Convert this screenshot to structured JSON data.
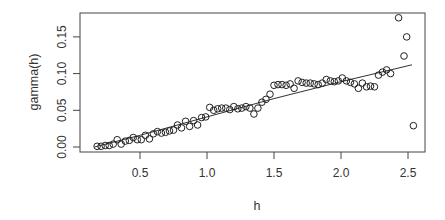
{
  "chart_data": {
    "type": "scatter",
    "title": "",
    "xlabel": "h",
    "ylabel": "gamma(h)",
    "xlim": [
      0.05,
      2.62
    ],
    "ylim": [
      -0.006,
      0.185
    ],
    "xticks": [
      0.5,
      1.0,
      1.5,
      2.0,
      2.5
    ],
    "xtick_labels": [
      "0.5",
      "1.0",
      "1.5",
      "2.0",
      "2.5"
    ],
    "yticks": [
      0.0,
      0.05,
      0.1,
      0.15
    ],
    "ytick_labels": [
      "0.00",
      "0.05",
      "0.10",
      "0.15"
    ],
    "grid": false,
    "legend": null,
    "series": [
      {
        "name": "empirical semivariogram",
        "marker": "open-circle",
        "x": [
          0.18,
          0.21,
          0.24,
          0.27,
          0.3,
          0.33,
          0.36,
          0.39,
          0.42,
          0.45,
          0.48,
          0.51,
          0.54,
          0.57,
          0.6,
          0.63,
          0.66,
          0.69,
          0.72,
          0.75,
          0.78,
          0.81,
          0.84,
          0.87,
          0.9,
          0.93,
          0.96,
          0.99,
          1.02,
          1.05,
          1.08,
          1.11,
          1.14,
          1.17,
          1.2,
          1.23,
          1.26,
          1.29,
          1.32,
          1.35,
          1.38,
          1.41,
          1.44,
          1.47,
          1.5,
          1.53,
          1.56,
          1.59,
          1.62,
          1.65,
          1.68,
          1.71,
          1.74,
          1.77,
          1.8,
          1.83,
          1.86,
          1.89,
          1.92,
          1.95,
          1.98,
          2.01,
          2.04,
          2.07,
          2.1,
          2.13,
          2.16,
          2.19,
          2.22,
          2.25,
          2.28,
          2.31,
          2.34,
          2.37,
          2.43,
          2.47,
          2.49,
          2.54
        ],
        "y": [
          0.001,
          0.001,
          0.002,
          0.002,
          0.004,
          0.01,
          0.004,
          0.008,
          0.009,
          0.013,
          0.01,
          0.01,
          0.016,
          0.011,
          0.018,
          0.021,
          0.019,
          0.02,
          0.022,
          0.023,
          0.03,
          0.026,
          0.035,
          0.028,
          0.036,
          0.03,
          0.04,
          0.041,
          0.054,
          0.05,
          0.052,
          0.053,
          0.053,
          0.051,
          0.055,
          0.052,
          0.053,
          0.055,
          0.053,
          0.045,
          0.053,
          0.061,
          0.065,
          0.072,
          0.084,
          0.085,
          0.085,
          0.084,
          0.086,
          0.08,
          0.09,
          0.088,
          0.087,
          0.087,
          0.086,
          0.085,
          0.087,
          0.092,
          0.09,
          0.089,
          0.09,
          0.094,
          0.09,
          0.088,
          0.086,
          0.08,
          0.087,
          0.082,
          0.083,
          0.082,
          0.098,
          0.102,
          0.105,
          0.1,
          0.176,
          0.124,
          0.15,
          0.029
        ]
      },
      {
        "name": "fitted model",
        "style": "line",
        "x": [
          0.16,
          0.5,
          1.0,
          1.5,
          2.0,
          2.53
        ],
        "y": [
          0.0,
          0.016,
          0.041,
          0.066,
          0.089,
          0.112
        ]
      }
    ]
  }
}
